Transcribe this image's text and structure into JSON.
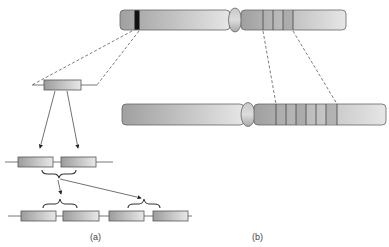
{
  "figure": {
    "panel_a_label": "(a)",
    "panel_b_label": "(b)"
  },
  "colors": {
    "outline": "#555555",
    "chrom_dark": "#9a9a9a",
    "chrom_light": "#e4e4e4",
    "band_black": "#111111"
  }
}
